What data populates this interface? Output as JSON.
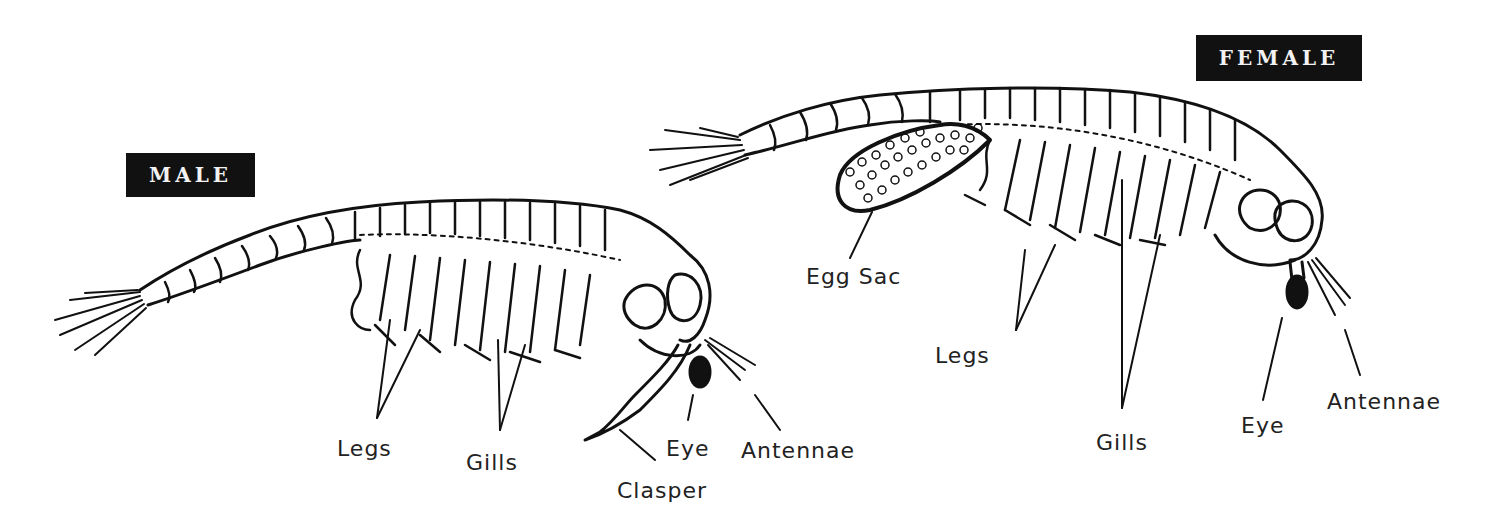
{
  "diagram": {
    "male": {
      "title": "MALE",
      "labels": {
        "legs": "Legs",
        "gills": "Gills",
        "clasper": "Clasper",
        "eye": "Eye",
        "antennae": "Antennae"
      }
    },
    "female": {
      "title": "FEMALE",
      "labels": {
        "egg_sac": "Egg Sac",
        "legs": "Legs",
        "gills": "Gills",
        "eye": "Eye",
        "antennae": "Antennae"
      }
    },
    "colors": {
      "ink": "#111111",
      "background": "#ffffff",
      "badge_text": "#f2f2f2"
    }
  }
}
